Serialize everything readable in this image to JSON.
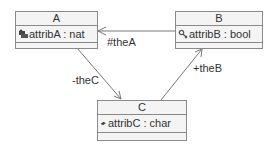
{
  "diagram": {
    "type": "uml-class-diagram",
    "classes": [
      {
        "name": "A",
        "attribute": "attribA : nat",
        "visibility_icon": "protected-key-icon"
      },
      {
        "name": "B",
        "attribute": "attribB : bool",
        "visibility_icon": "package-icon"
      },
      {
        "name": "C",
        "attribute": "attribC : char",
        "visibility_icon": "private-diamond-icon"
      }
    ],
    "associations": [
      {
        "from": "B",
        "to": "A",
        "role": "#theA"
      },
      {
        "from": "A",
        "to": "C",
        "role": "-theC"
      },
      {
        "from": "C",
        "to": "B",
        "role": "+theB"
      }
    ]
  },
  "colors": {
    "line": "#777777",
    "box_fill": "#f4f4f4",
    "box_border": "#8a8a8a",
    "text": "#333333"
  }
}
